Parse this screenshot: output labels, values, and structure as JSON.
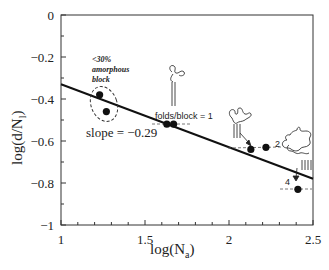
{
  "chart_data": {
    "type": "scatter",
    "title": "",
    "xlabel": "log(N_a)",
    "ylabel": "log(d/N_l)",
    "xlim": [
      1,
      2.5
    ],
    "ylim": [
      -1,
      0
    ],
    "xticks": [
      1,
      1.5,
      2,
      2.5
    ],
    "xtick_labels": [
      "1",
      "1.5",
      "2",
      "2.5"
    ],
    "yticks": [
      0,
      -0.2,
      -0.4,
      -0.6,
      -0.8,
      -1
    ],
    "ytick_labels": [
      "0",
      "−0.2",
      "−0.4",
      "−0.6",
      "−0.8",
      "−1"
    ],
    "grid": false,
    "legend": null,
    "series": [
      {
        "name": "data",
        "x": [
          1.23,
          1.27,
          1.63,
          1.67,
          2.13,
          2.22,
          2.41
        ],
        "y": [
          -0.38,
          -0.46,
          -0.52,
          -0.52,
          -0.64,
          -0.63,
          -0.83
        ]
      }
    ],
    "fit_line": {
      "slope": -0.29,
      "x": [
        1,
        2.5
      ],
      "y": [
        -0.33,
        -0.78
      ]
    },
    "annotations": [
      {
        "text": "<30%",
        "x": 1.24,
        "y": -0.23,
        "style": "italic-bold"
      },
      {
        "text": "amorphous",
        "x": 1.24,
        "y": -0.27,
        "style": "italic-bold"
      },
      {
        "text": "block",
        "x": 1.24,
        "y": -0.31,
        "style": "italic-bold"
      },
      {
        "text": "slope = −0.29",
        "x": 1.3,
        "y": -0.56
      },
      {
        "text": "folds/block = 1",
        "x": 1.63,
        "y": -0.48
      },
      {
        "text": "2",
        "x": 2.28,
        "y": -0.62
      },
      {
        "text": "4",
        "x": 2.33,
        "y": -0.81
      }
    ]
  },
  "labels": {
    "xlabel_main": "log(N",
    "xlabel_sub": "a",
    "xlabel_close": ")",
    "ylabel_main": "log(d/N",
    "ylabel_sub": "l",
    "ylabel_close": ")",
    "amorphous_1": "<30%",
    "amorphous_2": "amorphous",
    "amorphous_3": "block",
    "slope": "slope = −0.29",
    "folds": "folds/block = 1",
    "n2": "2",
    "n4": "4"
  }
}
